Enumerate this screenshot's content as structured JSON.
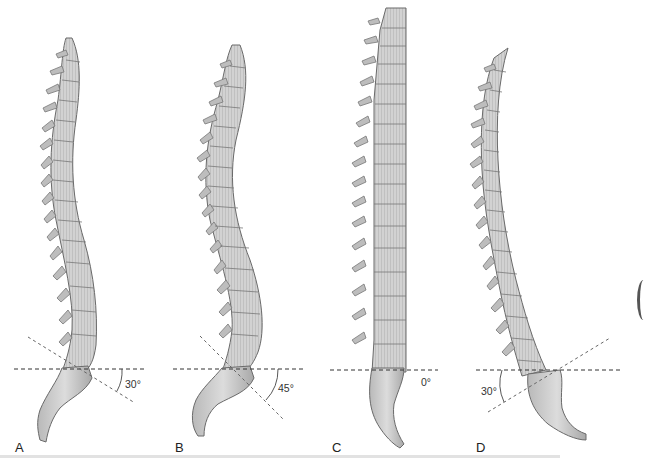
{
  "figure": {
    "colors": {
      "bone_fill": "#c9c9c9",
      "bone_shade": "#8e8e8e",
      "bone_outline": "#6a6a6a",
      "reference_line": "#333333",
      "sacral_line": "#555555",
      "background": "#ffffff"
    },
    "panels": [
      {
        "label": "A",
        "angle": "30°",
        "sacral_tilt": "posterior-down",
        "curvature": "normal"
      },
      {
        "label": "B",
        "angle": "45°",
        "sacral_tilt": "posterior-down",
        "curvature": "increased lordosis"
      },
      {
        "label": "C",
        "angle": "0°",
        "sacral_tilt": "vertical",
        "curvature": "flat"
      },
      {
        "label": "D",
        "angle": "30°",
        "sacral_tilt": "anterior-down",
        "curvature": "reversed"
      }
    ]
  }
}
